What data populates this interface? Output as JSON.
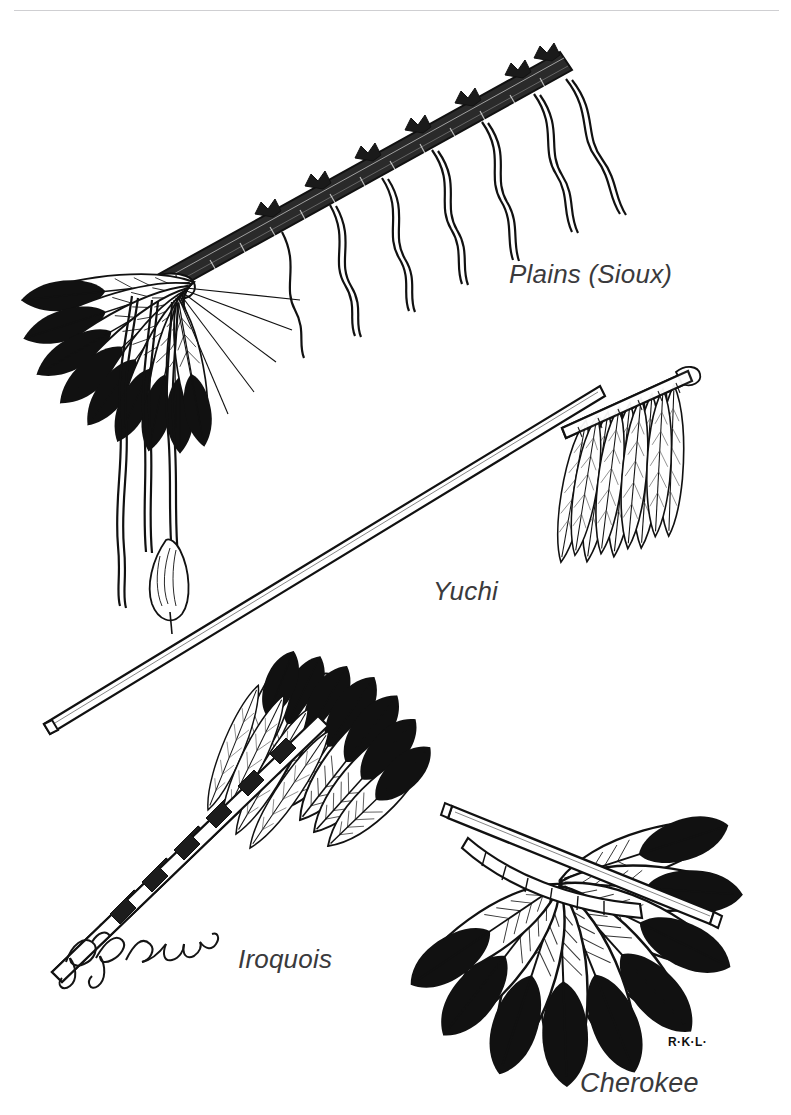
{
  "plate": {
    "title": "Native American Ceremonial Feather Fans",
    "medium": "pen-and-ink line illustration",
    "background_color": "#ffffff",
    "ink_color": "#111111",
    "rule_color": "#cfcfd2",
    "width": 791,
    "height": 1115
  },
  "captions": {
    "plains": "Plains (Sioux)",
    "yuchi": "Yuchi",
    "iroquois": "Iroquois",
    "cherokee": "Cherokee"
  },
  "signatures": {
    "cursive": "R. K. Laubin",
    "initials": "R·K·L·"
  },
  "figures": [
    {
      "id": "plains-sioux-fan",
      "label": "Plains (Sioux)",
      "description": "Long diagonal wrapped staff with tufted bindings along its length, trailing hanging cords, and a spread fan of eagle feathers with black tips at the lower-left end.",
      "feather_count": 9,
      "feather_tips": "black",
      "handle": "wrapped staff with quill-work bindings"
    },
    {
      "id": "yuchi-fan",
      "label": "Yuchi",
      "description": "Very long slender tapered stick handle running diagonally, with a short crossbar at the upper right from which hang pale, loosely bound feathers.",
      "feather_count": 8,
      "feather_tips": "white",
      "handle": "long tapered stick with crossbar"
    },
    {
      "id": "iroquois-fan",
      "label": "Iroquois",
      "description": "Angled handle with alternating banded wrapping and a small tuft at the tip, supporting a cluster of feathers whose upper ends are solid black.",
      "feather_count": 7,
      "feather_tips": "black",
      "handle": "banded wrapped rod with tuft"
    },
    {
      "id": "cherokee-fan",
      "label": "Cherokee",
      "description": "Straight rod with a curved lashed rib beneath it holding a wide radiating spread of eagle feathers with heavy black tips.",
      "feather_count": 9,
      "feather_tips": "black",
      "handle": "straight rod with curved lashed rib"
    }
  ],
  "corner_mark": {
    "name": "buffalo-silhouette",
    "description": "Small solid black bison silhouette at the lower right corner of the plate."
  }
}
